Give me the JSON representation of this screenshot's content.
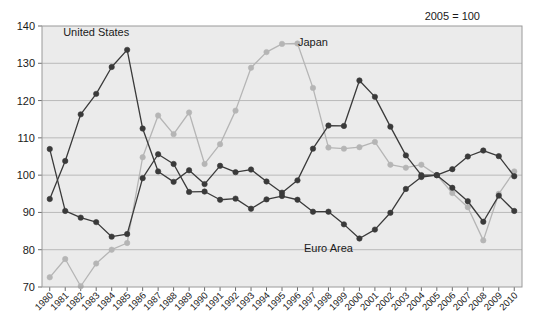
{
  "chart_data": {
    "type": "line",
    "title": "",
    "note": "2005 = 100",
    "xlabel": "",
    "ylabel": "",
    "ylim": [
      70,
      140
    ],
    "yticks": [
      70,
      80,
      90,
      100,
      110,
      120,
      130,
      140
    ],
    "grid": true,
    "legend_position": "inline-annotations",
    "x": [
      "1980",
      "1981",
      "1982",
      "1983",
      "1984",
      "1985",
      "1986",
      "1987",
      "1988",
      "1989",
      "1990",
      "1991",
      "1992",
      "1993",
      "1994",
      "1995",
      "1996",
      "1997",
      "1998",
      "1999",
      "2000",
      "2001",
      "2002",
      "2003",
      "2004",
      "2005",
      "2006",
      "2007",
      "2008",
      "2009",
      "2010"
    ],
    "categories": [
      "1980",
      "1981",
      "1982",
      "1983",
      "1984",
      "1985",
      "1986",
      "1987",
      "1988",
      "1989",
      "1990",
      "1991",
      "1992",
      "1993",
      "1994",
      "1995",
      "1996",
      "1997",
      "1998",
      "1999",
      "2000",
      "2001",
      "2002",
      "2003",
      "2004",
      "2005",
      "2006",
      "2007",
      "2008",
      "2009",
      "2010"
    ],
    "series": [
      {
        "name": "United States",
        "color": "#3a3a3a",
        "marker_color": "#3a3a3a",
        "values": [
          93.6,
          103.8,
          116.3,
          121.8,
          129.0,
          133.6,
          112.5,
          101.0,
          98.2,
          101.3,
          97.6,
          102.5,
          100.8,
          101.5,
          98.3,
          95.3,
          98.6,
          107.1,
          113.3,
          113.2,
          125.4,
          121.0,
          113.0,
          105.3,
          100.0,
          100.0,
          96.6,
          93.0,
          87.5,
          94.5,
          90.4
        ]
      },
      {
        "name": "Japan",
        "color": "#b5b5b5",
        "marker_color": "#b5b5b5",
        "values": [
          72.6,
          77.5,
          70.2,
          76.3,
          80.0,
          81.8,
          104.8,
          116.0,
          111.0,
          116.8,
          103.0,
          108.3,
          117.3,
          128.8,
          133.0,
          135.2,
          135.3,
          123.4,
          107.4,
          107.1,
          107.5,
          108.9,
          102.8,
          102.0,
          102.8,
          100.0,
          95.2,
          91.4,
          82.5,
          95.0,
          101.0
        ]
      },
      {
        "name": "Euro Area",
        "color": "#3a3a3a",
        "marker_color": "#3a3a3a",
        "values": [
          107.0,
          90.4,
          88.6,
          87.4,
          83.5,
          84.2,
          99.2,
          105.6,
          103.0,
          95.5,
          95.6,
          93.4,
          93.7,
          91.0,
          93.5,
          94.4,
          93.4,
          90.2,
          90.2,
          86.8,
          83.0,
          85.4,
          89.9,
          96.3,
          99.5,
          100.0,
          101.6,
          105.0,
          106.6,
          105.1,
          99.7
        ]
      }
    ],
    "annotations": [
      {
        "text": "United States",
        "x": "1983",
        "y": 137.2,
        "name": "series-label-united-states"
      },
      {
        "text": "Japan",
        "x": "1997",
        "y": 134.6,
        "name": "series-label-japan"
      },
      {
        "text": "Euro Area",
        "x": "1998",
        "y": 79.5,
        "name": "series-label-euro-area"
      },
      {
        "text": "2005 = 100",
        "x": "2006",
        "y": 141.5,
        "name": "note-index-base"
      }
    ]
  }
}
